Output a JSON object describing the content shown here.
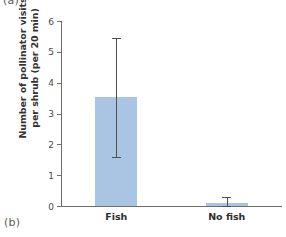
{
  "panels": {
    "label_a": "(a)",
    "label_b": "(b)"
  },
  "chart_data": {
    "type": "bar",
    "title": "",
    "xlabel": "",
    "ylabel_line1": "Number of pollinator visits",
    "ylabel_line2": "per shrub (per 20 min)",
    "ylabel": "Number of pollinator visits per shrub (per 20 min)",
    "categories": [
      "Fish",
      "No fish"
    ],
    "values": [
      3.53,
      0.1
    ],
    "errors_low": [
      1.6,
      0.0
    ],
    "errors_high": [
      5.45,
      0.28
    ],
    "ylim": [
      0,
      6
    ],
    "yticks": [
      0,
      1,
      2,
      3,
      4,
      5,
      6
    ],
    "ytick_labels": [
      "0",
      "1",
      "2",
      "3",
      "4",
      "5",
      "6"
    ],
    "grid": false,
    "legend": "none",
    "bar_color": "#a9c5e3",
    "axis_color": "#6d6d6d",
    "error_color": "#4f4f4f"
  }
}
